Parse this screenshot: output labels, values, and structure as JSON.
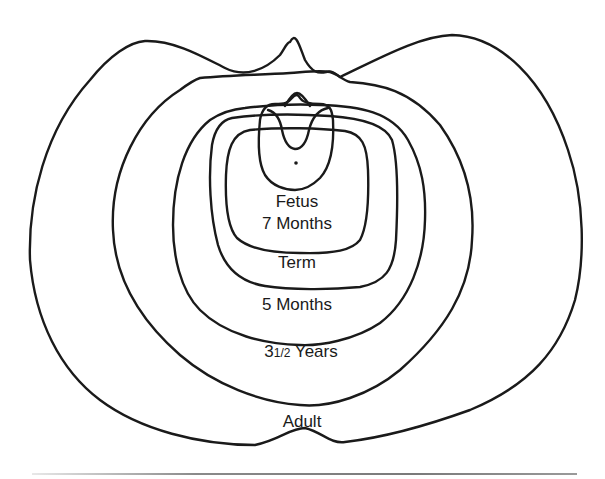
{
  "figure": {
    "type": "diagram",
    "stroke_color": "#1a1a1a",
    "background": "#ffffff"
  },
  "labels": {
    "fetus": "Fetus",
    "seven_months": "7 Months",
    "term": "Term",
    "five_months": "5 Months",
    "three_half_years_whole": "3",
    "three_half_years_fraction": "1/2",
    "three_half_years_unit": " Years",
    "adult": "Adult"
  },
  "outlines": [
    {
      "id": "adult",
      "label": "Adult",
      "order": 6
    },
    {
      "id": "three-half-years",
      "label": "3 1/2 Years",
      "order": 5
    },
    {
      "id": "five-months",
      "label": "5 Months",
      "order": 4
    },
    {
      "id": "term",
      "label": "Term",
      "order": 3
    },
    {
      "id": "seven-months",
      "label": "7 Months",
      "order": 2
    },
    {
      "id": "fetus",
      "label": "Fetus",
      "order": 1
    }
  ]
}
